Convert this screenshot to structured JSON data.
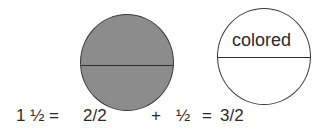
{
  "diagram": {
    "circles": [
      {
        "name": "whole-circle",
        "fill": "#8c8c8c",
        "label": ""
      },
      {
        "name": "half-circle",
        "fill": "#ffffff",
        "label": "colored"
      }
    ],
    "equation": {
      "lhs": "1 ½ =",
      "term1": "2/2",
      "plus": "+",
      "term2": "½",
      "equals": "=",
      "result": "3/2"
    }
  }
}
